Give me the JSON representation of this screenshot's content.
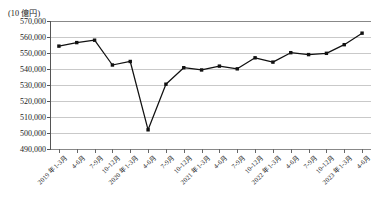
{
  "chart_data": {
    "type": "line",
    "title": "",
    "unit_note": "(10 億円)",
    "xlabel": "",
    "ylabel": "",
    "ylim": [
      490000,
      570000
    ],
    "ytick_step": 10000,
    "ytick_labels": [
      "570,000",
      "560,000",
      "550,000",
      "540,000",
      "530,000",
      "520,000",
      "510,000",
      "500,000",
      "490,000"
    ],
    "ytick_values": [
      570000,
      560000,
      550000,
      540000,
      530000,
      520000,
      510000,
      500000,
      490000
    ],
    "grid": true,
    "legend": "none",
    "marker": "filled-square",
    "line_color": "#111111",
    "categories": [
      "2019 年1-3月",
      "4-6月",
      "7-9月",
      "10-12月",
      "2020 年1-3月",
      "4-6月",
      "7-9月",
      "10-12月",
      "2021 年1-3月",
      "4-6月",
      "7-9月",
      "10-12月",
      "2022 年1-3月",
      "4-6月",
      "7-9月",
      "10-12月",
      "2023 年1-3月",
      "4-6月"
    ],
    "values": [
      554300,
      556500,
      558000,
      542500,
      544700,
      502000,
      530500,
      540800,
      539400,
      541800,
      540100,
      547000,
      544300,
      550200,
      549000,
      549800,
      555200,
      562400
    ]
  }
}
